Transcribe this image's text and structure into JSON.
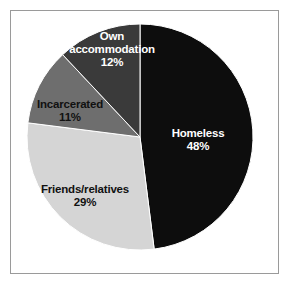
{
  "figure": {
    "background_color": "#ffffff",
    "frame_color": "#9a9a9a"
  },
  "chart_data": {
    "type": "pie",
    "title": "",
    "subtitle": "",
    "xlabel": "",
    "ylabel": "",
    "legend": "none",
    "grid": false,
    "units": "percent",
    "start_angle_deg": 0,
    "direction": "clockwise",
    "total": 100,
    "categories": [
      "Homeless",
      "Friends/relatives",
      "Incarcerated",
      "Own accommodation"
    ],
    "values": [
      48,
      29,
      11,
      12
    ],
    "slices": [
      {
        "label": "Homeless",
        "value": 48,
        "value_text": "48%",
        "color": "#0d0d0d",
        "text_color": "#ffffff",
        "label_lines": [
          "Homeless",
          "48%"
        ]
      },
      {
        "label": "Friends/relatives",
        "value": 29,
        "value_text": "29%",
        "color": "#d5d5d5",
        "text_color": "#111111",
        "label_lines": [
          "Friends/relatives",
          "29%"
        ]
      },
      {
        "label": "Incarcerated",
        "value": 11,
        "value_text": "11%",
        "color": "#6e6e6e",
        "text_color": "#111111",
        "label_lines": [
          "Incarcerated",
          "11%"
        ]
      },
      {
        "label": "Own accommodation",
        "value": 12,
        "value_text": "12%",
        "color": "#3a3a3a",
        "text_color": "#ffffff",
        "label_lines": [
          "Own",
          "accommodation",
          "12%"
        ]
      }
    ]
  },
  "geometry": {
    "center_x": 140,
    "center_y": 137,
    "radius": 113
  },
  "label_positions": [
    {
      "x": 198,
      "y": 140,
      "anchor": "middle"
    },
    {
      "x": 85,
      "y": 196,
      "anchor": "middle"
    },
    {
      "x": 70,
      "y": 111,
      "anchor": "middle"
    },
    {
      "x": 112,
      "y": 50,
      "anchor": "middle"
    }
  ]
}
